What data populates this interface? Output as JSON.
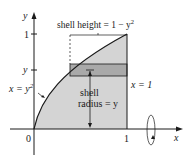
{
  "diagram": {
    "axes": {
      "x_label": "x",
      "y_label": "y",
      "origin_label": "0",
      "x_tick_label": "1",
      "y_tick_label_top": "1",
      "y_tick_label_mid": "y"
    },
    "labels": {
      "curve": "x = y",
      "curve_exp": "2",
      "line": "x = 1",
      "shell_height": "shell height = 1 − y",
      "shell_height_exp": "2",
      "shell_radius_line1": "shell",
      "shell_radius_line2": "radius = y"
    },
    "colors": {
      "region_fill": "#d4d4d4",
      "shell_fill": "#a9a9a9",
      "stroke": "#1a1a1a",
      "background": "#ffffff"
    }
  }
}
